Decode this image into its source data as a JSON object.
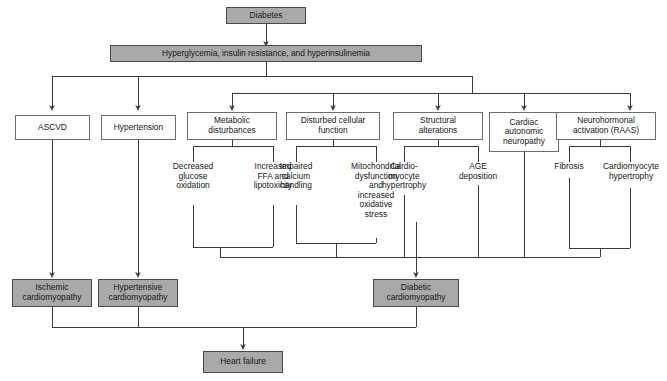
{
  "diagram": {
    "type": "flowchart",
    "title_text": "",
    "colors": {
      "filled_box_fill": "#a9a9a9",
      "filled_box_border": "#4a4a4a",
      "outline_box_fill": "#ffffff",
      "outline_box_border": "#6d6d6d",
      "connector": "#3b3b3b",
      "text": "#17171a",
      "background": "#ffffff"
    },
    "nodes": {
      "root": {
        "label": "Diabetes",
        "style": "filled"
      },
      "mechanism": {
        "label": "Hyperglycemia, insulin resistance, and hyperinsulinemia",
        "style": "filled"
      },
      "ascvd": {
        "label": "ASCVD",
        "style": "outline"
      },
      "hypertension": {
        "label": "Hypertension",
        "style": "outline"
      },
      "metabolic": {
        "label": "Metabolic\ndisturbances",
        "style": "outline"
      },
      "cellular": {
        "label": "Disturbed cellular\nfunction",
        "style": "outline"
      },
      "structural": {
        "label": "Structural\nalterations",
        "style": "outline"
      },
      "autonomic": {
        "label": "Cardiac\nautonomic\nneuropathy",
        "style": "outline"
      },
      "neurohormonal": {
        "label": "Neurohormonal\nactivation (RAAS)",
        "style": "outline"
      },
      "decreased_glucose": {
        "label": "Decreased\nglucose\noxidation",
        "style": "plain"
      },
      "increased_ffa": {
        "label": "Increased\nFFA and\nlipotoxicity",
        "style": "plain"
      },
      "impaired_calcium": {
        "label": "Impaired\ncalcium\nhandling",
        "style": "plain"
      },
      "mitochondrial": {
        "label": "Mitochondrial\ndysfunction\nand\nincreased\noxidative\nstress",
        "style": "plain"
      },
      "cardiomyocyte_hypertrophy_left": {
        "label": "Cardio-\nmyocyte\nhypertrophy",
        "style": "plain"
      },
      "age_deposition": {
        "label": "AGE\ndeposition",
        "style": "plain"
      },
      "fibrosis": {
        "label": "Fibrosis",
        "style": "plain"
      },
      "cardiomyocyte_hypertrophy_right": {
        "label": "Cardiomyocyte\nhypertrophy",
        "style": "plain"
      },
      "ischemic": {
        "label": "Ischemic\ncardiomyopathy",
        "style": "filled"
      },
      "hypertensive": {
        "label": "Hypertensive\ncardiomyopathy",
        "style": "filled"
      },
      "diabetic": {
        "label": "Diabetic\ncardiomyopathy",
        "style": "filled"
      },
      "heart_failure": {
        "label": "Heart failure",
        "style": "filled"
      }
    },
    "edges": [
      {
        "from": "root",
        "to": "mechanism"
      },
      {
        "from": "mechanism",
        "to": "ascvd"
      },
      {
        "from": "mechanism",
        "to": "hypertension"
      },
      {
        "from": "mechanism",
        "to": "metabolic"
      },
      {
        "from": "mechanism",
        "to": "cellular"
      },
      {
        "from": "mechanism",
        "to": "structural"
      },
      {
        "from": "mechanism",
        "to": "autonomic"
      },
      {
        "from": "mechanism",
        "to": "neurohormonal"
      },
      {
        "from": "metabolic",
        "to": "decreased_glucose"
      },
      {
        "from": "metabolic",
        "to": "increased_ffa"
      },
      {
        "from": "cellular",
        "to": "impaired_calcium"
      },
      {
        "from": "cellular",
        "to": "mitochondrial"
      },
      {
        "from": "structural",
        "to": "cardiomyocyte_hypertrophy_left"
      },
      {
        "from": "structural",
        "to": "age_deposition"
      },
      {
        "from": "neurohormonal",
        "to": "fibrosis"
      },
      {
        "from": "neurohormonal",
        "to": "cardiomyocyte_hypertrophy_right"
      },
      {
        "from": "ascvd",
        "to": "ischemic"
      },
      {
        "from": "hypertension",
        "to": "hypertensive"
      },
      {
        "from": "metabolic_branch",
        "to": "diabetic"
      },
      {
        "from": "cellular_branch",
        "to": "diabetic"
      },
      {
        "from": "structural_branch",
        "to": "diabetic"
      },
      {
        "from": "autonomic",
        "to": "diabetic"
      },
      {
        "from": "neurohormonal_branch",
        "to": "diabetic"
      },
      {
        "from": "ischemic",
        "to": "heart_failure"
      },
      {
        "from": "hypertensive",
        "to": "heart_failure"
      },
      {
        "from": "diabetic",
        "to": "heart_failure"
      }
    ]
  }
}
